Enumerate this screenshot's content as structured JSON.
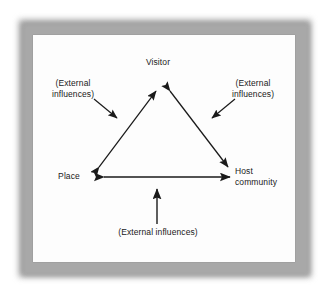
{
  "figure": {
    "type": "relationship-triangle-diagram",
    "background_color": "#ffffff",
    "panel_color": "#fdfdfd",
    "frame_color": "#9a9a9a",
    "line_color": "#1a1a1a"
  },
  "nodes": {
    "top": {
      "label": "Visitor"
    },
    "left": {
      "label": "Place"
    },
    "right": {
      "label": "Host\ncommunity"
    }
  },
  "influences": {
    "left": {
      "label": "(External\ninfluences)"
    },
    "right": {
      "label": "(External\ninfluences)"
    },
    "bottom": {
      "label": "(External influences)"
    }
  },
  "connections": [
    {
      "from": "Place",
      "to": "Visitor",
      "style": "double-headed-arrow"
    },
    {
      "from": "Visitor",
      "to": "Host community",
      "style": "double-headed-arrow"
    },
    {
      "from": "Place",
      "to": "Host community",
      "style": "double-headed-arrow"
    },
    {
      "from": "(External influences)",
      "to": "Place-Visitor edge",
      "style": "single-arrow"
    },
    {
      "from": "(External influences)",
      "to": "Visitor-Host edge",
      "style": "single-arrow"
    },
    {
      "from": "(External influences)",
      "to": "Place-Host edge",
      "style": "single-arrow"
    }
  ]
}
